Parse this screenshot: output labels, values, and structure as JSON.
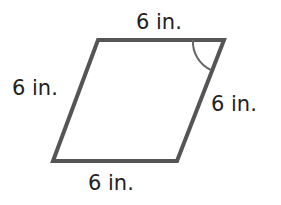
{
  "figure": {
    "shape": "rhombus",
    "stroke_color": "#555555",
    "labels": {
      "top": "6 in.",
      "left": "6 in.",
      "right": "6 in.",
      "bottom": "6 in."
    },
    "angle_mark": "top-right"
  }
}
